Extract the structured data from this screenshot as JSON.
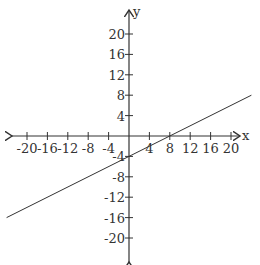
{
  "chart_data": {
    "type": "line",
    "title": "",
    "xlabel": "x",
    "ylabel": "y",
    "xlim": [
      -20,
      20
    ],
    "ylim": [
      -20,
      20
    ],
    "grid": false,
    "x_ticks": [
      -20,
      -16,
      -12,
      -8,
      -4,
      4,
      8,
      12,
      16,
      20
    ],
    "x_tick_labels": [
      "-20",
      "-16",
      "-12",
      "-8",
      "-4",
      "4",
      "8",
      "12",
      "16",
      "20"
    ],
    "y_ticks": [
      20,
      16,
      12,
      8,
      4,
      -4,
      -8,
      -12,
      -16,
      -20
    ],
    "y_tick_labels": [
      "20",
      "16",
      "12",
      "8",
      "4",
      "-4",
      "-8",
      "-12",
      "-16",
      "-20"
    ],
    "series": [
      {
        "name": "y = x/2 - 4",
        "equation": "y = 0.5x - 4",
        "x": [
          -24,
          0,
          8,
          24
        ],
        "y": [
          -16,
          -4,
          0,
          8
        ]
      }
    ]
  },
  "axes": {
    "x_label": "x",
    "y_label": "y"
  }
}
